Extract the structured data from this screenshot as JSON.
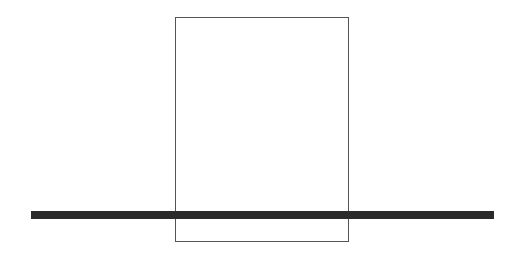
{
  "diagram": {
    "shapes": [
      {
        "type": "rectangle",
        "stroke": "#555555",
        "fill": "#ffffff"
      },
      {
        "type": "horizontal-line",
        "stroke": "#2a2a2a",
        "thickness": 8
      }
    ]
  }
}
